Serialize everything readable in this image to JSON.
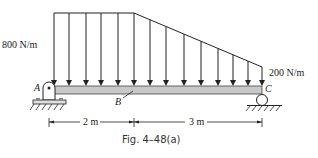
{
  "diagram": {
    "caption": "Fig. 4–48(a)",
    "load_left_label": "800 N/m",
    "load_right_label": "200 N/m",
    "point_a": "A",
    "point_b": "B",
    "point_c": "C",
    "dim_left": "2 m",
    "dim_right": "3 m",
    "beam_color": "#c8c8c8",
    "line_color": "#222222"
  }
}
